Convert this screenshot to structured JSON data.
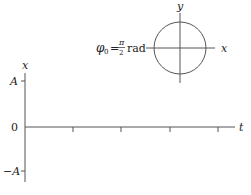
{
  "phasor": {
    "phase_symbol": "φ",
    "phase_subscript": "0",
    "equals": "=",
    "frac_num": "π",
    "frac_den": "2",
    "unit": "rad",
    "x_label": "x",
    "y_label": "y"
  },
  "graph": {
    "vertical_axis_label": "x",
    "horizontal_axis_label": "t",
    "tick_labels": {
      "top": "A",
      "zero": "0",
      "bottom": "−A"
    },
    "t_tick_count": 4
  },
  "colors": {
    "line": "#555555",
    "text": "#222222"
  }
}
